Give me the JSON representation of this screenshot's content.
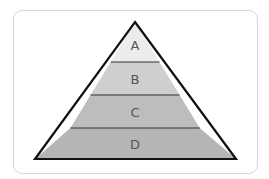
{
  "diagram": {
    "type": "pyramid",
    "levels": [
      {
        "label": "A",
        "color": "#ececec"
      },
      {
        "label": "B",
        "color": "#cfcfcf"
      },
      {
        "label": "C",
        "color": "#bdbdbd"
      },
      {
        "label": "D",
        "color": "#b5b5b5"
      }
    ],
    "outline_color": "#111111"
  }
}
